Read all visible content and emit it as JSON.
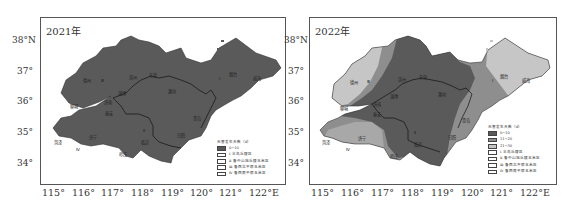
{
  "figure": {
    "panels": [
      {
        "year_label": "2021年",
        "lat_labels": [
          "38°N",
          "37°",
          "36°",
          "35°",
          "34°"
        ],
        "lon_labels": [
          "115°",
          "116°",
          "117°",
          "118°",
          "119°",
          "120°",
          "121°",
          "122°E"
        ],
        "legend": {
          "title": "无害发生天数（d）",
          "items": [
            {
              "label": "0~10",
              "color": "#5a5a5a"
            },
            {
              "label": "Ⅰ 半岛丘陵区",
              "color": "#ffffff"
            },
            {
              "label": "Ⅱ 鲁中山地丘陵玉米区",
              "color": "#ffffff"
            },
            {
              "label": "Ⅲ 鲁西北平原玉米区",
              "color": "#ffffff"
            },
            {
              "label": "Ⅳ 鲁西南平原玉米区",
              "color": "#ffffff"
            }
          ]
        },
        "city_labels": [
          "德州",
          "Ⅲ",
          "滨州",
          "东营",
          "聊城",
          "淄博",
          "潍坊",
          "济南",
          "泰安",
          "青岛",
          "菏泽",
          "济宁",
          "Ⅱ",
          "临沂",
          "日照",
          "Ⅳ",
          "枣庄",
          "烟台",
          "威海",
          "Ⅰ"
        ]
      },
      {
        "year_label": "2022年",
        "lat_labels": [
          "38°N",
          "37°",
          "36°",
          "35°",
          "34°"
        ],
        "lon_labels": [
          "115°",
          "116°",
          "117°",
          "118°",
          "119°",
          "120°",
          "121°",
          "122°E"
        ],
        "legend": {
          "title": "无害发生天数（d）",
          "items": [
            {
              "label": "0~10",
              "color": "#5a5a5a"
            },
            {
              "label": "11~20",
              "color": "#8e8e8e"
            },
            {
              "label": "21~30",
              "color": "#c6c6c6"
            },
            {
              "label": "Ⅰ 半岛丘陵区",
              "color": "#ffffff"
            },
            {
              "label": "Ⅱ 鲁中山地丘陵玉米区",
              "color": "#ffffff"
            },
            {
              "label": "Ⅲ 鲁西北平原玉米区",
              "color": "#ffffff"
            },
            {
              "label": "Ⅳ 鲁西南平原玉米区",
              "color": "#ffffff"
            }
          ]
        },
        "city_labels": [
          "德州",
          "Ⅲ",
          "滨州",
          "东营",
          "聊城",
          "淄博",
          "潍坊",
          "济南",
          "泰安",
          "青岛",
          "菏泽",
          "济宁",
          "Ⅱ",
          "临沂",
          "日照",
          "Ⅳ",
          "枣庄",
          "烟台",
          "威海",
          "Ⅰ"
        ]
      }
    ]
  },
  "colors": {
    "dark": "#5a5a5a",
    "medium": "#8e8e8e",
    "light": "#c6c6c6",
    "border": "#222222"
  }
}
